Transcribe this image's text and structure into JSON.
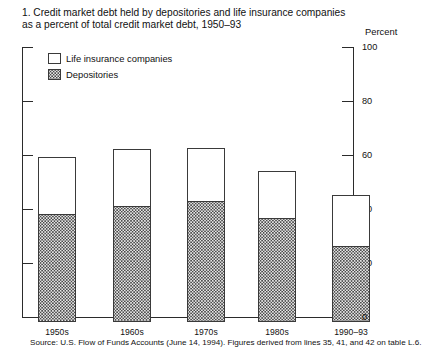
{
  "title": {
    "line1": "1. Credit market debt held by depositories and life insurance companies",
    "line2": "as a percent of total credit market debt, 1950–93"
  },
  "axis": {
    "percent_caption": "Percent",
    "tick_100": "100",
    "tick_80": "80",
    "tick_60": "60",
    "tick_40": "40",
    "tick_20": "20",
    "tick_0": "0"
  },
  "legend": {
    "items": [
      {
        "label": "Life insurance companies",
        "swatch": "open-white-square",
        "color": "#ffffff"
      },
      {
        "label": "Depositories",
        "swatch": "stippled-gray-square",
        "color": "#e8e8e8"
      }
    ]
  },
  "source": "Source: U.S. Flow of Funds Accounts (June 14, 1994).  Figures derived from  lines 35, 41, and 42 on table L.6.",
  "chart_data": {
    "type": "bar",
    "subtype": "stacked",
    "title": "1. Credit market debt held by depositories and life insurance companies as a percent of total credit market debt, 1950–93",
    "xlabel": "",
    "ylabel": "Percent",
    "ylim": [
      0,
      100
    ],
    "yticks": [
      0,
      20,
      40,
      60,
      80,
      100
    ],
    "grid": false,
    "legend_position": "upper-left-inside",
    "categories": [
      "1950s",
      "1960s",
      "1970s",
      "1980s",
      "1990–93"
    ],
    "series": [
      {
        "name": "Depositories",
        "values": [
          40,
          43,
          45,
          38.5,
          28
        ]
      },
      {
        "name": "Life insurance companies",
        "values": [
          21,
          21,
          19.5,
          17.5,
          19
        ]
      }
    ],
    "totals": [
      61,
      64,
      64.5,
      56,
      47
    ]
  }
}
